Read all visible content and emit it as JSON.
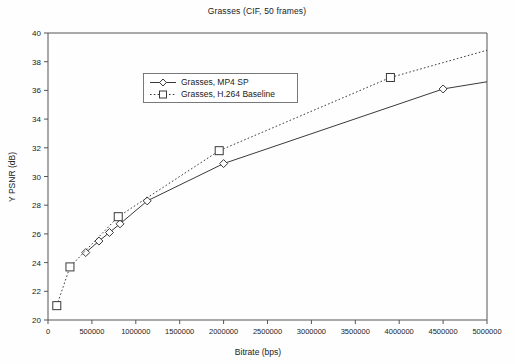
{
  "chart_data": {
    "type": "line",
    "title": "Grasses (CIF, 50 frames)",
    "xlabel": "Bitrate (bps)",
    "ylabel": "Y PSNR (dB)",
    "xlim": [
      0,
      5000000
    ],
    "ylim": [
      20,
      40
    ],
    "xticks": [
      0,
      500000,
      1000000,
      1500000,
      2000000,
      2500000,
      3000000,
      3500000,
      4000000,
      4500000,
      5000000
    ],
    "xtick_labels": [
      "0",
      "500000",
      "1000000",
      "1500000",
      "2000000",
      "2500000",
      "3000000",
      "3500000",
      "4000000",
      "4500000",
      "5000000"
    ],
    "yticks": [
      20,
      22,
      24,
      26,
      28,
      30,
      32,
      34,
      36,
      38,
      40
    ],
    "ytick_labels": [
      "20",
      "22",
      "24",
      "26",
      "28",
      "30",
      "32",
      "34",
      "36",
      "38",
      "40"
    ],
    "grid": false,
    "legend_position": "upper-left-inside",
    "series": [
      {
        "name": "Grasses, MP4 SP",
        "marker": "diamond",
        "line_style": "solid",
        "color": "#3a3a3a",
        "points": [
          {
            "x": 430000,
            "y": 24.7
          },
          {
            "x": 580000,
            "y": 25.5
          },
          {
            "x": 700000,
            "y": 26.1
          },
          {
            "x": 820000,
            "y": 26.7
          },
          {
            "x": 1130000,
            "y": 28.3
          },
          {
            "x": 2000000,
            "y": 30.9
          },
          {
            "x": 4500000,
            "y": 36.1
          }
        ],
        "extension_to": {
          "x": 5000000,
          "y": 36.6
        }
      },
      {
        "name": "Grasses, H.264 Baseline",
        "marker": "square",
        "line_style": "dotted",
        "color": "#3a3a3a",
        "points": [
          {
            "x": 100000,
            "y": 21.0
          },
          {
            "x": 250000,
            "y": 23.7
          },
          {
            "x": 800000,
            "y": 27.2
          },
          {
            "x": 1950000,
            "y": 31.8
          },
          {
            "x": 3900000,
            "y": 36.9
          }
        ],
        "extension_to": {
          "x": 5000000,
          "y": 38.8
        }
      }
    ]
  },
  "legend": {
    "entries": [
      {
        "label": "Grasses, MP4 SP"
      },
      {
        "label": "Grasses, H.264 Baseline"
      }
    ]
  }
}
